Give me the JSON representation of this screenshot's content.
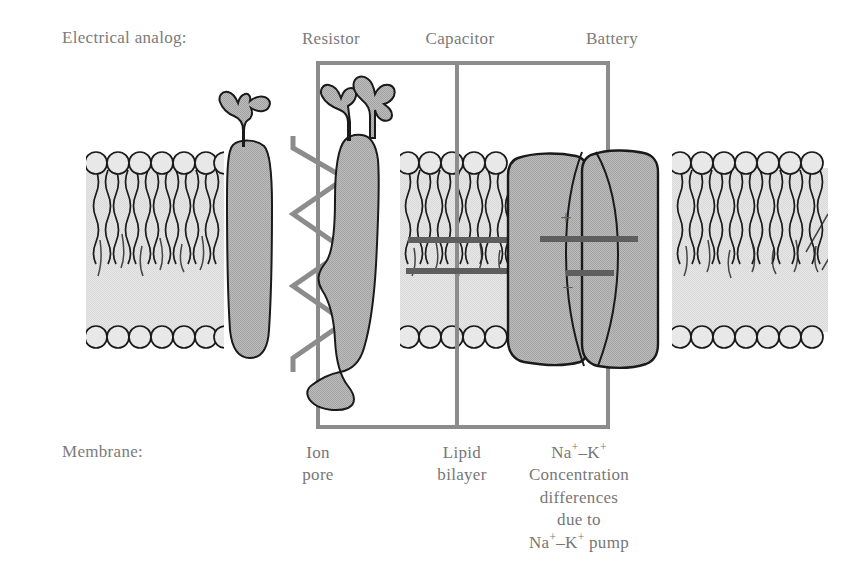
{
  "figure": {
    "title_row_label": "Electrical analog:",
    "bottom_row_label": "Membrane:",
    "background_color": "#ffffff",
    "text_color": "#7b7b7b",
    "protein_fill": "#b3b3b3",
    "lipid_fill": "#e3e3e3",
    "outline_color": "#1a1a1a",
    "box_color": "#8c8c8c",
    "symbol_color": "#6e6e6e"
  },
  "electrical_analog": {
    "row_label": "Electrical analog:",
    "items": [
      {
        "label": "Resistor",
        "x": 330
      },
      {
        "label": "Capacitor",
        "x": 460
      },
      {
        "label": "Battery",
        "x": 613
      }
    ]
  },
  "membrane_labels": {
    "row_label": "Membrane:",
    "items": [
      {
        "id": "ion-pore",
        "lines": [
          "Ion",
          "pore"
        ],
        "x": 318
      },
      {
        "id": "lipid-bilayer",
        "lines": [
          "Lipid",
          "bilayer"
        ],
        "x": 462
      },
      {
        "id": "na-k-pump",
        "lines": [
          "Na+-K+",
          "Concentration",
          "differences",
          "due to",
          "Na+-K+ pump"
        ],
        "x": 578
      }
    ],
    "ion_pore_line1": "Ion",
    "ion_pore_line2": "pore",
    "lipid_line1": "Lipid",
    "lipid_line2": "bilayer",
    "pump_line2": "Concentration",
    "pump_line3": "differences",
    "pump_line4": "due to",
    "na_text": "Na",
    "k_text": "K",
    "plus_sup": "+",
    "dash": "–",
    "pump_word": " pump"
  },
  "symbols": {
    "battery_plus": "+",
    "battery_minus": "−",
    "resistor_name": "resistor-zigzag",
    "capacitor_name": "capacitor-plates",
    "battery_name": "battery-cell"
  },
  "box": {
    "left": 318,
    "right": 608,
    "top": 63,
    "bottom": 427,
    "divider_x": 457
  }
}
